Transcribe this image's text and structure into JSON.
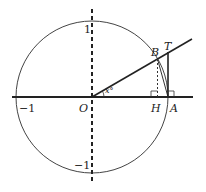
{
  "diagram": {
    "type": "unit-circle",
    "labels": {
      "origin": "O",
      "point_b": "B",
      "point_t": "T",
      "point_h": "H",
      "point_a": "A",
      "y_pos": "1",
      "y_neg": "−1",
      "x_neg": "−1",
      "angle": "x°"
    },
    "colors": {
      "stroke": "#222222",
      "circle": "#444444",
      "background": "#ffffff"
    }
  }
}
